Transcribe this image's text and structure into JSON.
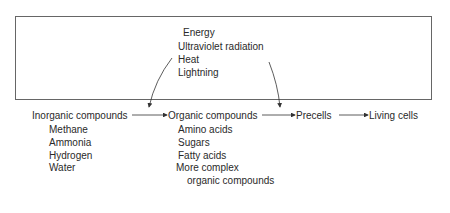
{
  "energy": {
    "title": "Energy",
    "sources": [
      "Ultraviolet radiation",
      "Heat",
      "Lightning"
    ]
  },
  "stages": [
    {
      "label": "Inorganic compounds",
      "items": [
        "Methane",
        "Ammonia",
        "Hydrogen",
        "Water"
      ]
    },
    {
      "label": "Organic compounds",
      "items": [
        "Amino acids",
        "Sugars",
        "Fatty acids",
        "More complex",
        "organic compounds"
      ]
    },
    {
      "label": "Precells",
      "items": []
    },
    {
      "label": "Living cells",
      "items": []
    }
  ]
}
